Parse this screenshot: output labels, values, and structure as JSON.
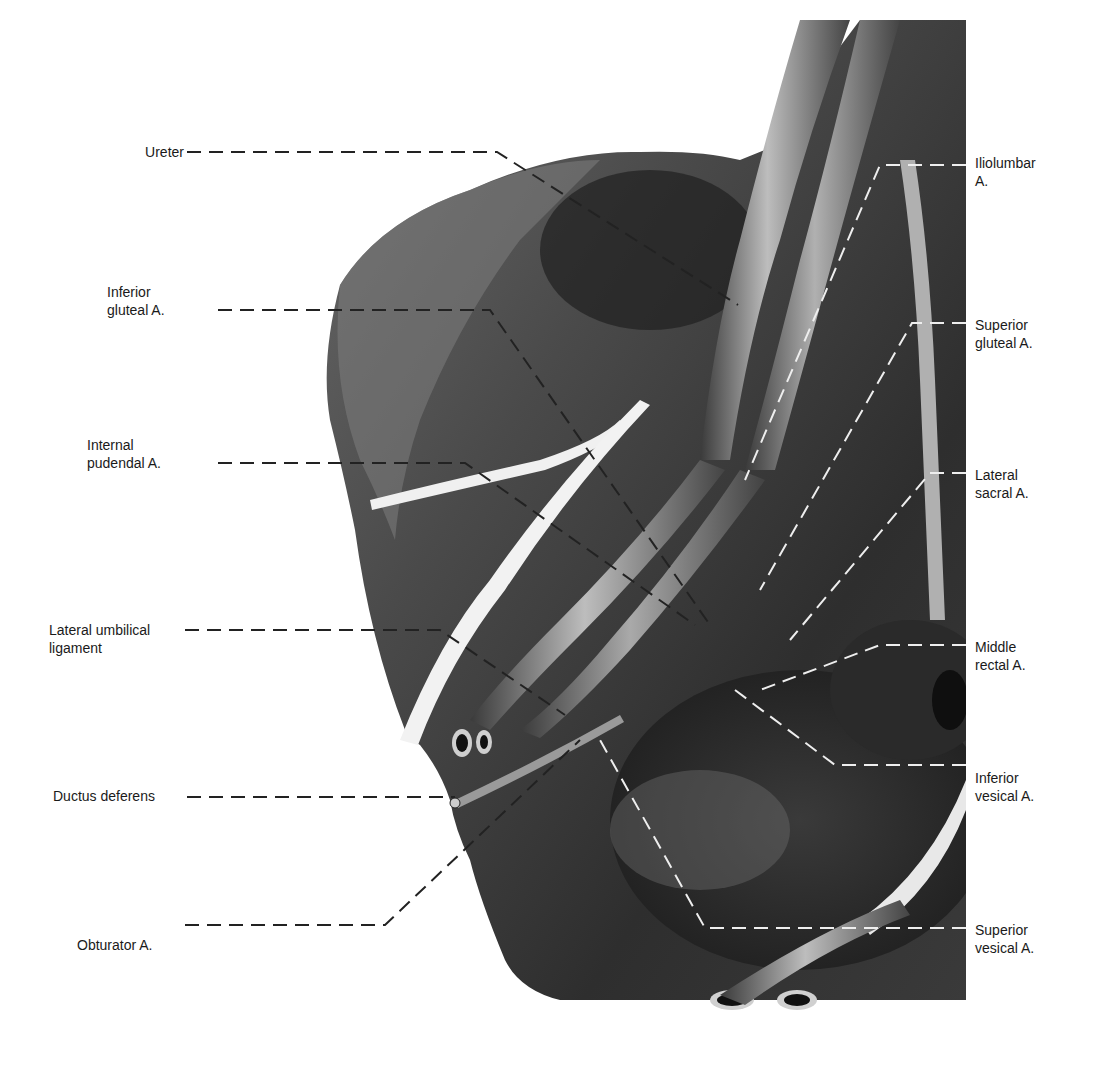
{
  "figure": {
    "background": "#ffffff",
    "tissue_dark": "#2a2a2a",
    "tissue_mid": "#555555",
    "tissue_light": "#8a8a8a",
    "vessel_highlight": "#d8d8d8"
  },
  "labels": {
    "left": [
      {
        "id": "ureter",
        "lines": [
          "Ureter"
        ]
      },
      {
        "id": "inferior-gluteal",
        "lines": [
          "Inferior",
          "gluteal A."
        ]
      },
      {
        "id": "internal-pudendal",
        "lines": [
          "Internal",
          "pudendal A."
        ]
      },
      {
        "id": "lateral-umbilical",
        "lines": [
          "Lateral umbilical",
          "ligament"
        ]
      },
      {
        "id": "ductus-deferens",
        "lines": [
          "Ductus deferens"
        ]
      },
      {
        "id": "obturator",
        "lines": [
          "Obturator A."
        ]
      }
    ],
    "right": [
      {
        "id": "iliolumbar",
        "lines": [
          "Iliolumbar",
          "A."
        ]
      },
      {
        "id": "superior-gluteal",
        "lines": [
          "Superior",
          "gluteal A."
        ]
      },
      {
        "id": "lateral-sacral",
        "lines": [
          "Lateral",
          "sacral A."
        ]
      },
      {
        "id": "middle-rectal",
        "lines": [
          "Middle",
          "rectal A."
        ]
      },
      {
        "id": "inferior-vesical",
        "lines": [
          "Inferior",
          "vesical A."
        ]
      },
      {
        "id": "superior-vesical",
        "lines": [
          "Superior",
          "vesical A."
        ]
      }
    ]
  }
}
